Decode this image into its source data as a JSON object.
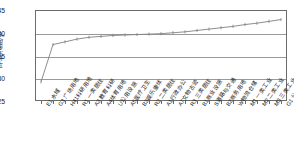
{
  "chart_data": {
    "type": "line",
    "title": "",
    "xlabel": "",
    "ylabel": "平均温度/℃",
    "ylim": [
      25,
      45
    ],
    "yticks": [
      25,
      30,
      35,
      40,
      45
    ],
    "grid": true,
    "legend": "none",
    "marker": "tick",
    "line_color": "#808080",
    "categories": [
      "E1 水域",
      "G3 广场用地",
      "H41科研用地",
      "R1 一类居住",
      "A3 教育科研",
      "A4体育用地",
      "U公用设施",
      "A5医疗卫生",
      "B3娱乐康体",
      "R2 二类居住",
      "A1行政办公",
      "A7文物古迹",
      "R3 三类居住",
      "B1商业设施",
      "S道路与交通",
      "B2商务用地",
      "W物流仓储",
      "M1 一类工业",
      "M2 二类工业",
      "M3 三类工业",
      "G1 公园绿地"
    ],
    "values": [
      29.2,
      37.4,
      38.0,
      38.6,
      39.0,
      39.2,
      39.4,
      39.5,
      39.6,
      39.7,
      39.8,
      40.0,
      40.2,
      40.5,
      40.8,
      41.1,
      41.4,
      41.8,
      42.1,
      42.5,
      42.9
    ]
  }
}
